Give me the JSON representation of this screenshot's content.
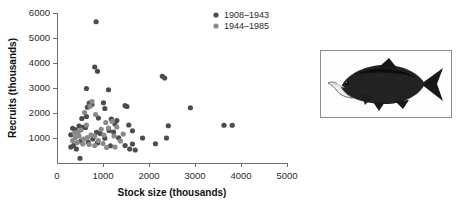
{
  "figure": {
    "photo_caption": "",
    "photo_alt_name": "sockeye-salmon-photo"
  },
  "chart_data": {
    "type": "scatter",
    "title": "",
    "xlabel": "Stock size (thousands)",
    "ylabel": "Recruits (thousands)",
    "xlim": [
      0,
      5000
    ],
    "ylim": [
      0,
      6000
    ],
    "xticks": [
      0,
      1000,
      2000,
      3000,
      4000,
      5000
    ],
    "yticks": [
      1000,
      2000,
      3000,
      4000,
      5000,
      6000
    ],
    "xtick_labels": [
      "0",
      "1000",
      "2000",
      "3000",
      "4000",
      "5000"
    ],
    "ytick_labels": [
      "1000",
      "2000",
      "3000",
      "4000",
      "5000",
      "6000"
    ],
    "grid": false,
    "legend_position": "top-right",
    "colors": {
      "series_1908_1943": "#4d4d4d",
      "series_1944_1985": "#8a8a8a",
      "axis": "#6f6f6f",
      "text": "#2b2b2b"
    },
    "series": [
      {
        "name": "1908–1943",
        "color": "#4d4d4d",
        "points": [
          [
            850,
            5650
          ],
          [
            820,
            3840
          ],
          [
            880,
            3670
          ],
          [
            2290,
            3470
          ],
          [
            2340,
            3400
          ],
          [
            640,
            2980
          ],
          [
            1120,
            2930
          ],
          [
            2900,
            2210
          ],
          [
            1480,
            2300
          ],
          [
            1520,
            2260
          ],
          [
            1010,
            2410
          ],
          [
            700,
            2400
          ],
          [
            760,
            2340
          ],
          [
            660,
            2230
          ],
          [
            1040,
            2180
          ],
          [
            640,
            1860
          ],
          [
            540,
            1780
          ],
          [
            900,
            1800
          ],
          [
            1180,
            1760
          ],
          [
            1300,
            1700
          ],
          [
            3630,
            1510
          ],
          [
            3810,
            1510
          ],
          [
            2420,
            1490
          ],
          [
            1260,
            1560
          ],
          [
            1560,
            1520
          ],
          [
            480,
            1480
          ],
          [
            560,
            1430
          ],
          [
            620,
            1420
          ],
          [
            340,
            1390
          ],
          [
            400,
            1330
          ],
          [
            1640,
            1290
          ],
          [
            1130,
            1300
          ],
          [
            1230,
            1240
          ],
          [
            860,
            1230
          ],
          [
            940,
            1180
          ],
          [
            300,
            1130
          ],
          [
            1860,
            1000
          ],
          [
            2380,
            1000
          ],
          [
            1340,
            1010
          ],
          [
            1040,
            990
          ],
          [
            780,
            960
          ],
          [
            2140,
            770
          ],
          [
            1640,
            760
          ],
          [
            1480,
            700
          ],
          [
            1160,
            690
          ],
          [
            880,
            800
          ],
          [
            680,
            830
          ],
          [
            520,
            880
          ],
          [
            360,
            700
          ],
          [
            300,
            640
          ],
          [
            420,
            560
          ],
          [
            1700,
            520
          ],
          [
            1580,
            560
          ],
          [
            500,
            190
          ]
        ]
      },
      {
        "name": "1944–1985",
        "color": "#8a8a8a",
        "points": [
          [
            760,
            2460
          ],
          [
            720,
            2270
          ],
          [
            600,
            2020
          ],
          [
            840,
            1940
          ],
          [
            1200,
            1660
          ],
          [
            1060,
            1620
          ],
          [
            1300,
            1440
          ],
          [
            1120,
            1400
          ],
          [
            960,
            1350
          ],
          [
            640,
            1520
          ],
          [
            520,
            1320
          ],
          [
            460,
            1240
          ],
          [
            380,
            1200
          ],
          [
            740,
            1120
          ],
          [
            820,
            1080
          ],
          [
            1020,
            1120
          ],
          [
            1240,
            1080
          ],
          [
            660,
            1020
          ],
          [
            580,
            960
          ],
          [
            900,
            900
          ],
          [
            1380,
            880
          ],
          [
            1440,
            1160
          ],
          [
            440,
            820
          ],
          [
            560,
            760
          ],
          [
            700,
            740
          ],
          [
            820,
            700
          ],
          [
            1000,
            780
          ],
          [
            1080,
            620
          ],
          [
            1260,
            640
          ],
          [
            340,
            900
          ],
          [
            400,
            1020
          ],
          [
            480,
            1080
          ]
        ]
      }
    ]
  },
  "legend": {
    "items": [
      {
        "label": "1908–1943",
        "color": "#4d4d4d"
      },
      {
        "label": "1944–1985",
        "color": "#8a8a8a"
      }
    ]
  }
}
